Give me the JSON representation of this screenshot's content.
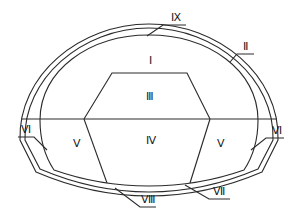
{
  "diagram": {
    "type": "tunnel cross-section excavation/support zoning",
    "regions": [
      {
        "id": "I",
        "label": "Ⅰ",
        "desc": "upper crown zone"
      },
      {
        "id": "III",
        "label": "Ⅲ",
        "desc": "central upper trapezoid"
      },
      {
        "id": "IV",
        "label": "Ⅳ",
        "desc": "central lower core"
      },
      {
        "id": "V-left",
        "label": "Ⅴ",
        "desc": "left side bench"
      },
      {
        "id": "V-right",
        "label": "Ⅴ",
        "desc": "right side bench"
      }
    ],
    "callouts": [
      {
        "id": "IX",
        "label": "Ⅸ",
        "target": "outer lining layer (crown)"
      },
      {
        "id": "II",
        "label": "Ⅱ",
        "target": "outer lining ring (right shoulder)"
      },
      {
        "id": "VI-left",
        "label": "Ⅵ",
        "target": "left wall lining"
      },
      {
        "id": "VI-right",
        "label": "Ⅵ",
        "target": "right wall lining"
      },
      {
        "id": "VII",
        "label": "Ⅶ",
        "target": "invert lining"
      },
      {
        "id": "VIII",
        "label": "Ⅷ",
        "target": "invert core"
      }
    ]
  }
}
